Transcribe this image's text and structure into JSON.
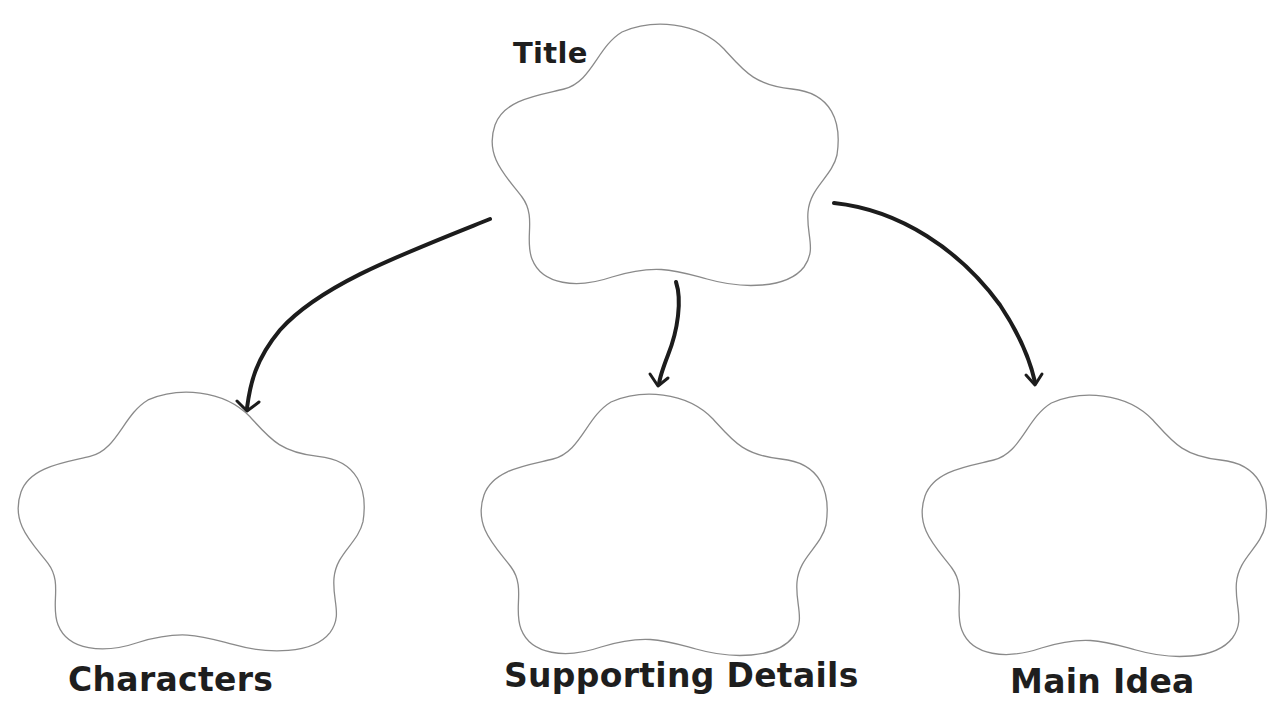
{
  "diagram": {
    "type": "graphic-organizer",
    "colors": {
      "background": "#ffffff",
      "shape_outline": "#8a8a8a",
      "arrow": "#1c1c1c",
      "text": "#1e1e1e"
    },
    "nodes": [
      {
        "id": "title",
        "label": "Title",
        "shape": "flower-cloud"
      },
      {
        "id": "characters",
        "label": "Characters",
        "shape": "flower-cloud"
      },
      {
        "id": "supporting-details",
        "label": "Supporting Details",
        "shape": "flower-cloud"
      },
      {
        "id": "main-idea",
        "label": "Main Idea",
        "shape": "flower-cloud"
      }
    ],
    "edges": [
      {
        "from": "title",
        "to": "characters"
      },
      {
        "from": "title",
        "to": "supporting-details"
      },
      {
        "from": "title",
        "to": "main-idea"
      }
    ]
  }
}
